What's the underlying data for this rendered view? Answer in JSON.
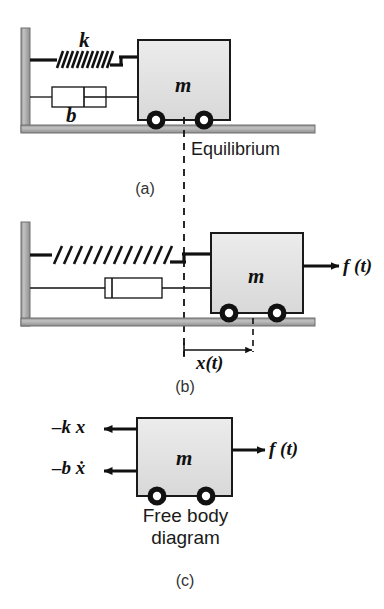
{
  "figure": {
    "colors": {
      "ink": "#111111",
      "caption": "#333333",
      "mass_fill": "#e2e2e2",
      "mass_stroke": "#1a1a1a",
      "wall_fill": "#b3b3b3",
      "wall_edge": "#6e6e6e",
      "ground_fill": "#b3b3b3",
      "ground_edge": "#6e6e6e",
      "wheel": "#111111",
      "wheel_hub": "#ffffff",
      "background": "#ffffff"
    }
  },
  "panels": [
    {
      "id": "a",
      "caption": "(a)",
      "description": "Spring and damper at rest, mass at equilibrium position",
      "labels": {
        "spring": "k",
        "damper": "b",
        "mass": "m",
        "equilibrium": "Equilibrium"
      }
    },
    {
      "id": "b",
      "caption": "(b)",
      "description": "Mass displaced right by x(t) under applied force f(t)",
      "labels": {
        "mass": "m",
        "force": "f (t)",
        "displacement": "x(t)"
      }
    },
    {
      "id": "c",
      "caption": "(c)",
      "description": "Free body diagram of the mass",
      "labels": {
        "mass": "m",
        "spring_force": "–k x",
        "damping_force": "–b ẋ",
        "applied_force": "f (t)",
        "title_line1": "Free body",
        "title_line2": "diagram"
      }
    }
  ]
}
